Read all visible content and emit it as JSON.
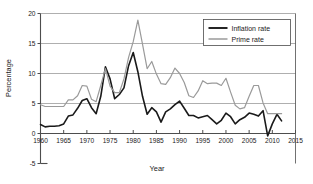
{
  "chart_data": {
    "type": "line",
    "title": "",
    "xlabel": "Year",
    "ylabel": "Percentage",
    "xlim": [
      1960,
      2015
    ],
    "ylim": [
      -5,
      20
    ],
    "xticks": [
      1960,
      1965,
      1970,
      1975,
      1980,
      1985,
      1990,
      1995,
      2000,
      2005,
      2010,
      2015
    ],
    "yticks": [
      20,
      15,
      10,
      5,
      0,
      -5
    ],
    "grid": "horizontal",
    "legend_position": "top-right",
    "x": [
      1960,
      1961,
      1962,
      1963,
      1964,
      1965,
      1966,
      1967,
      1968,
      1969,
      1970,
      1971,
      1972,
      1973,
      1974,
      1975,
      1976,
      1977,
      1978,
      1979,
      1980,
      1981,
      1982,
      1983,
      1984,
      1985,
      1986,
      1987,
      1988,
      1989,
      1990,
      1991,
      1992,
      1993,
      1994,
      1995,
      1996,
      1997,
      1998,
      1999,
      2000,
      2001,
      2002,
      2003,
      2004,
      2005,
      2006,
      2007,
      2008,
      2009,
      2010,
      2011,
      2012
    ],
    "series": [
      {
        "name": "Inflation rate",
        "color": "#1a1a1a",
        "width": 1.6,
        "values": [
          1.5,
          1.1,
          1.2,
          1.2,
          1.3,
          1.6,
          2.9,
          3.1,
          4.2,
          5.5,
          5.8,
          4.3,
          3.3,
          6.2,
          11.1,
          9.1,
          5.8,
          6.5,
          7.6,
          11.3,
          13.5,
          10.3,
          6.2,
          3.2,
          4.3,
          3.6,
          1.9,
          3.6,
          4.1,
          4.8,
          5.4,
          4.2,
          3.0,
          3.0,
          2.6,
          2.8,
          3.0,
          2.3,
          1.6,
          2.2,
          3.4,
          2.8,
          1.6,
          2.3,
          2.7,
          3.4,
          3.2,
          2.9,
          3.8,
          -0.4,
          1.6,
          3.2,
          2.1
        ]
      },
      {
        "name": "Prime rate",
        "color": "#9a9a9a",
        "width": 1.2,
        "values": [
          4.8,
          4.5,
          4.5,
          4.5,
          4.5,
          4.5,
          5.6,
          5.6,
          6.3,
          8.0,
          7.9,
          5.7,
          5.3,
          8.0,
          10.8,
          7.9,
          6.8,
          6.8,
          9.1,
          12.7,
          15.3,
          18.9,
          14.9,
          10.8,
          12.0,
          9.9,
          8.3,
          8.2,
          9.3,
          10.9,
          10.0,
          8.5,
          6.3,
          6.0,
          7.1,
          8.8,
          8.3,
          8.4,
          8.4,
          8.0,
          9.2,
          6.9,
          4.7,
          4.1,
          4.3,
          6.2,
          8.0,
          8.0,
          5.1,
          3.3,
          3.3,
          3.3,
          3.3
        ]
      }
    ]
  },
  "legend": {
    "items": [
      {
        "label": "Inflation rate"
      },
      {
        "label": "Prime rate"
      }
    ]
  },
  "axes": {
    "x_title": "Year",
    "y_title": "Percentage",
    "x_tick_labels": [
      "1960",
      "1965",
      "1970",
      "1975",
      "1980",
      "1985",
      "1990",
      "1995",
      "2000",
      "2005",
      "2010",
      "2015"
    ],
    "y_tick_labels": [
      "20",
      "15",
      "10",
      "5",
      "0",
      "-5"
    ]
  },
  "colors": {
    "inflation": "#1a1a1a",
    "prime": "#9a9a9a",
    "grid": "#8c8c8c",
    "frame": "#4d4d4d",
    "background": "#ffffff"
  }
}
